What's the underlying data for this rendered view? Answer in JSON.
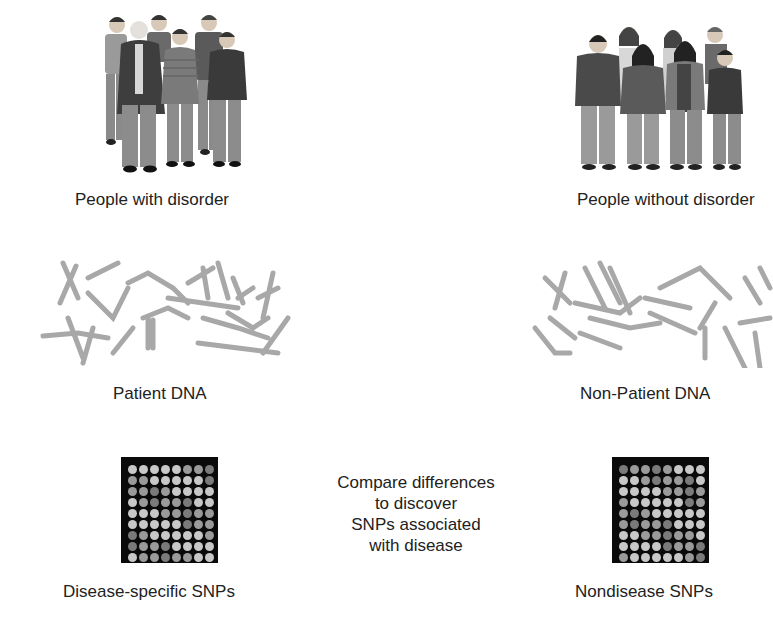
{
  "groups": {
    "disorder": {
      "people_label": "People with disorder",
      "dna_label": "Patient DNA",
      "snp_label": "Disease-specific SNPs"
    },
    "control": {
      "people_label": "People without disorder",
      "dna_label": "Non-Patient DNA",
      "snp_label": "Nondisease SNPs"
    }
  },
  "center_caption": [
    "Compare differences",
    "to discover",
    "SNPs associated",
    "with disease"
  ],
  "microarray": {
    "rows": 9,
    "cols": 8,
    "colors": {
      "background": "#0a0a0a",
      "light": "#c8c8c8",
      "mid": "#9a9a9a",
      "dark": "#7a7a7a"
    }
  },
  "colors": {
    "text": "#222222",
    "chromosome": "#a0a0a0",
    "background": "#ffffff"
  }
}
